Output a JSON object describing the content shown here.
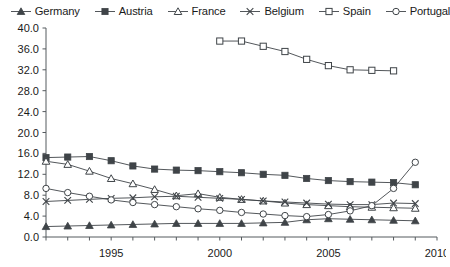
{
  "chart_data": {
    "type": "line",
    "title": "",
    "subtitle": "",
    "xlabel": "",
    "ylabel": "",
    "xlim": [
      1992,
      2010
    ],
    "ylim": [
      0.0,
      40.0
    ],
    "y_ticks": [
      "0.0",
      "4.0",
      "8.0",
      "12.0",
      "16.0",
      "20.0",
      "24.0",
      "28.0",
      "32.0",
      "36.0",
      "40.0"
    ],
    "y_tick_values": [
      0.0,
      4.0,
      8.0,
      12.0,
      16.0,
      20.0,
      24.0,
      28.0,
      32.0,
      36.0,
      40.0
    ],
    "x_ticks": [
      "1995",
      "2000",
      "2005",
      "2010"
    ],
    "x_tick_values": [
      1995,
      2000,
      2005,
      2010
    ],
    "x_minor_step": 1,
    "grid": false,
    "legend_position": "top",
    "series": [
      {
        "name": "Germany",
        "marker": "filled-triangle",
        "x": [
          1992,
          1993,
          1994,
          1995,
          1996,
          1997,
          1998,
          1999,
          2000,
          2001,
          2002,
          2003,
          2004,
          2005,
          2006,
          2007,
          2008,
          2009
        ],
        "values": [
          2.0,
          2.1,
          2.2,
          2.3,
          2.4,
          2.5,
          2.6,
          2.6,
          2.6,
          2.6,
          2.7,
          2.8,
          3.3,
          3.5,
          3.4,
          3.3,
          3.2,
          3.1
        ]
      },
      {
        "name": "Austria",
        "marker": "filled-square",
        "x": [
          1992,
          1993,
          1994,
          1995,
          1996,
          1997,
          1998,
          1999,
          2000,
          2001,
          2002,
          2003,
          2004,
          2005,
          2006,
          2007,
          2008,
          2009
        ],
        "values": [
          15.2,
          15.3,
          15.4,
          14.6,
          13.6,
          13.0,
          12.8,
          12.7,
          12.5,
          12.3,
          12.0,
          11.8,
          11.2,
          10.8,
          10.6,
          10.5,
          10.4,
          10.0
        ]
      },
      {
        "name": "France",
        "marker": "open-triangle",
        "x": [
          1992,
          1993,
          1994,
          1995,
          1996,
          1997,
          1998,
          1999,
          2000,
          2001,
          2002,
          2003,
          2004,
          2005,
          2006,
          2007,
          2008,
          2009
        ],
        "values": [
          14.5,
          13.9,
          12.6,
          11.2,
          10.2,
          9.1,
          7.9,
          8.3,
          7.6,
          7.2,
          6.9,
          6.5,
          6.2,
          6.0,
          5.8,
          5.7,
          5.6,
          5.5
        ]
      },
      {
        "name": "Belgium",
        "marker": "cross-x",
        "x": [
          1992,
          1993,
          1994,
          1995,
          1996,
          1997,
          1998,
          1999,
          2000,
          2001,
          2002,
          2003,
          2004,
          2005,
          2006,
          2007,
          2008,
          2009
        ],
        "values": [
          6.8,
          7.0,
          7.2,
          7.4,
          7.5,
          7.7,
          7.8,
          7.6,
          7.4,
          7.2,
          6.9,
          6.7,
          6.5,
          6.3,
          6.2,
          6.2,
          6.5,
          6.4
        ]
      },
      {
        "name": "Spain",
        "marker": "open-square",
        "x": [
          2000,
          2001,
          2002,
          2003,
          2004,
          2005,
          2006,
          2007,
          2008
        ],
        "values": [
          37.5,
          37.5,
          36.5,
          35.5,
          34.0,
          32.8,
          32.0,
          31.9,
          31.8
        ]
      },
      {
        "name": "Portugal",
        "marker": "open-circle",
        "x": [
          1992,
          1993,
          1994,
          1995,
          1996,
          1997,
          1998,
          1999,
          2000,
          2001,
          2002,
          2003,
          2004,
          2005,
          2006,
          2007,
          2008,
          2009
        ],
        "values": [
          9.3,
          8.5,
          7.8,
          7.1,
          6.6,
          6.2,
          5.8,
          5.4,
          5.1,
          4.7,
          4.4,
          4.1,
          3.9,
          4.3,
          5.0,
          6.0,
          9.3,
          14.3
        ]
      }
    ]
  },
  "legend": {
    "items": [
      {
        "label": "Germany",
        "marker": "filled-triangle"
      },
      {
        "label": "Austria",
        "marker": "filled-square"
      },
      {
        "label": "France",
        "marker": "open-triangle"
      },
      {
        "label": "Belgium",
        "marker": "cross-x"
      },
      {
        "label": "Spain",
        "marker": "open-square"
      },
      {
        "label": "Portugal",
        "marker": "open-circle"
      }
    ]
  },
  "colors": {
    "line": "#3f4448",
    "axis": "#555a5e",
    "text": "#1a1a1a",
    "background": "#ffffff",
    "marker_fill_open": "#ffffff"
  }
}
